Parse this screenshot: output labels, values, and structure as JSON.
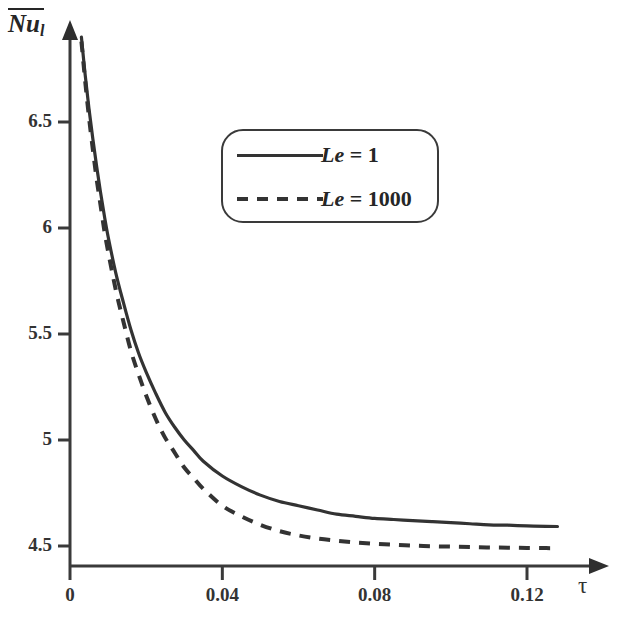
{
  "chart_data": {
    "type": "line",
    "title": "",
    "subtitle": "",
    "xlabel": "τ",
    "ylabel": "Nu_l",
    "ylabel_parts": {
      "base": "Nu",
      "subscript": "l",
      "overbar": true
    },
    "xlim": [
      0,
      0.1375
    ],
    "ylim": [
      4.38,
      7.0
    ],
    "xticks": [
      0,
      0.04,
      0.08,
      0.12
    ],
    "xtick_labels": [
      "0",
      "0.04",
      "0.08",
      "0.12"
    ],
    "yticks": [
      4.5,
      5,
      5.5,
      6,
      6.5
    ],
    "ytick_labels": [
      "4.5",
      "5",
      "5.5",
      "6",
      "6.5"
    ],
    "grid": false,
    "legend_position": "upper center",
    "axis_style": "arrowed-spines",
    "line_color": "#333333",
    "series": [
      {
        "name": "Le = 1",
        "label_symbol": "Le",
        "label_value": "1",
        "style": "solid",
        "color": "#333333",
        "asymptote": 4.59,
        "x": [
          0.003,
          0.004,
          0.005,
          0.006,
          0.007,
          0.008,
          0.009,
          0.01,
          0.012,
          0.014,
          0.016,
          0.018,
          0.02,
          0.0225,
          0.025,
          0.0275,
          0.03,
          0.0325,
          0.035,
          0.04,
          0.045,
          0.05,
          0.055,
          0.06,
          0.065,
          0.07,
          0.075,
          0.08,
          0.085,
          0.09,
          0.095,
          0.1,
          0.105,
          0.11,
          0.115,
          0.12,
          0.125,
          0.128
        ],
        "y": [
          6.9,
          6.72,
          6.56,
          6.42,
          6.29,
          6.17,
          6.06,
          5.96,
          5.79,
          5.65,
          5.52,
          5.41,
          5.32,
          5.22,
          5.13,
          5.06,
          5.0,
          4.95,
          4.9,
          4.83,
          4.78,
          4.74,
          4.71,
          4.69,
          4.67,
          4.65,
          4.64,
          4.63,
          4.625,
          4.62,
          4.615,
          4.61,
          4.605,
          4.6,
          4.598,
          4.595,
          4.593,
          4.592
        ]
      },
      {
        "name": "Le = 1000",
        "label_symbol": "Le",
        "label_value": "1000",
        "style": "dashed",
        "color": "#333333",
        "asymptote": 4.49,
        "x": [
          0.003,
          0.004,
          0.005,
          0.006,
          0.007,
          0.008,
          0.009,
          0.01,
          0.012,
          0.014,
          0.016,
          0.018,
          0.02,
          0.0225,
          0.025,
          0.0275,
          0.03,
          0.0325,
          0.035,
          0.04,
          0.045,
          0.05,
          0.055,
          0.06,
          0.065,
          0.07,
          0.075,
          0.08,
          0.085,
          0.09,
          0.095,
          0.1,
          0.105,
          0.11,
          0.115,
          0.12,
          0.125,
          0.128
        ],
        "y": [
          6.88,
          6.69,
          6.52,
          6.37,
          6.23,
          6.11,
          5.99,
          5.89,
          5.71,
          5.56,
          5.42,
          5.31,
          5.21,
          5.1,
          5.01,
          4.94,
          4.87,
          4.82,
          4.77,
          4.69,
          4.64,
          4.6,
          4.57,
          4.55,
          4.535,
          4.525,
          4.517,
          4.511,
          4.506,
          4.502,
          4.499,
          4.497,
          4.495,
          4.493,
          4.492,
          4.491,
          4.49,
          4.49
        ]
      }
    ]
  },
  "axis": {
    "y_title_base": "Nu",
    "y_title_sub": "l",
    "x_title": "τ"
  },
  "legend": {
    "items": [
      {
        "symbol": "Le",
        "eq": " = ",
        "value": "1",
        "style": "solid"
      },
      {
        "symbol": "Le",
        "eq": " = ",
        "value": "1000",
        "style": "dashed"
      }
    ]
  }
}
